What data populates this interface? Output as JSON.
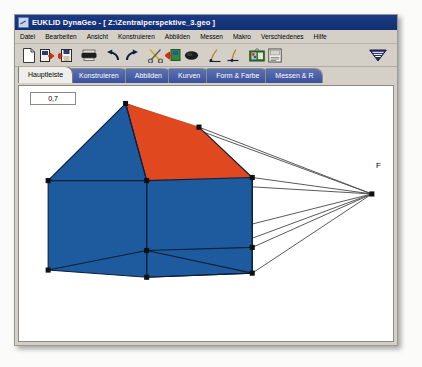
{
  "window": {
    "title": "EUKLID DynaGeo - [ Z:\\Zentralperspektive_3.geo ]",
    "icon": "euklid-app-icon"
  },
  "menubar": {
    "items": [
      {
        "label": "Datei"
      },
      {
        "label": "Bearbeiten"
      },
      {
        "label": "Ansicht"
      },
      {
        "label": "Konstruieren"
      },
      {
        "label": "Abbilden"
      },
      {
        "label": "Messen"
      },
      {
        "label": "Makro"
      },
      {
        "label": "Verschiedenes"
      },
      {
        "label": "Hilfe"
      }
    ]
  },
  "toolbar": {
    "buttons": [
      {
        "name": "new-document-icon"
      },
      {
        "name": "open-document-icon"
      },
      {
        "name": "save-document-icon"
      },
      {
        "name": "print-icon"
      },
      {
        "name": "undo-icon"
      },
      {
        "name": "redo-icon"
      },
      {
        "name": "cut-scissors-icon"
      },
      {
        "name": "paste-clipboard-icon"
      },
      {
        "name": "eraser-icon"
      },
      {
        "name": "draw-point-icon"
      },
      {
        "name": "draw-line-icon"
      },
      {
        "name": "color-palette-icon"
      },
      {
        "name": "text-label-icon"
      }
    ],
    "right_button": {
      "name": "dynageo-logo-icon"
    }
  },
  "tabs": [
    {
      "label": "Hauptleiste",
      "active": true
    },
    {
      "label": "Konstruieren",
      "active": false
    },
    {
      "label": "Abbilden",
      "active": false
    },
    {
      "label": "Kurven",
      "active": false
    },
    {
      "label": "Form & Farbe",
      "active": false
    },
    {
      "label": "Messen & R",
      "active": false
    }
  ],
  "canvas": {
    "value_box": {
      "value": "0,7"
    },
    "point_labels": [
      {
        "id": "F",
        "text": "F",
        "x": 357,
        "y": 76
      }
    ],
    "colors": {
      "roof_red": "#e0481f",
      "wall_blue": "#1d5b9e",
      "edge_dark": "#0d1f3a",
      "ray_line": "#3a3a3a",
      "vertex": "#101010",
      "background": "#ffffff"
    },
    "figure": {
      "description": "Zentralperspektive: Haus mit Fluchtpunkt F",
      "vertices": [
        {
          "id": "apex-front",
          "x": 106,
          "y": 17
        },
        {
          "id": "eave-front-left",
          "x": 29,
          "y": 92
        },
        {
          "id": "base-front-left",
          "x": 29,
          "y": 179
        },
        {
          "id": "eave-front-right",
          "x": 127,
          "y": 92
        },
        {
          "id": "base-front-right",
          "x": 127,
          "y": 160
        },
        {
          "id": "base-front-bottom",
          "x": 127,
          "y": 186
        },
        {
          "id": "apex-back",
          "x": 179,
          "y": 40
        },
        {
          "id": "eave-back-right",
          "x": 232,
          "y": 89
        },
        {
          "id": "base-back-right",
          "x": 232,
          "y": 157
        },
        {
          "id": "vanishing-point-F",
          "x": 351,
          "y": 105
        }
      ]
    }
  }
}
